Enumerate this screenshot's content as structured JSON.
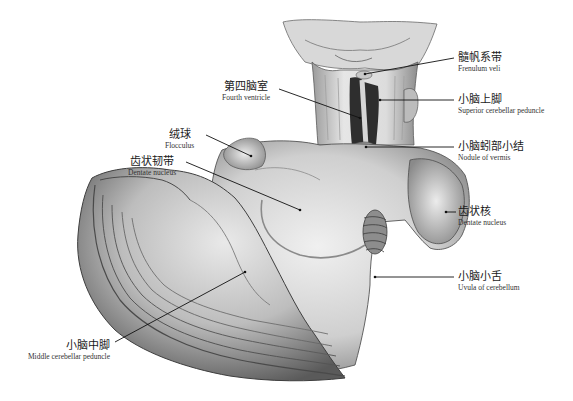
{
  "figure": {
    "colors": {
      "tissue_light": "#e8e8e8",
      "tissue_mid": "#b5b5b5",
      "tissue_dark": "#4a4a4a",
      "line": "#111111",
      "background": "#ffffff"
    }
  },
  "labels": [
    {
      "id": "frenulum-veli",
      "zh": "髓帆系带",
      "en": "Frenulum veli"
    },
    {
      "id": "fourth-ventricle",
      "zh": "第四脑室",
      "en": "Fourth ventricle"
    },
    {
      "id": "superior-cerebellar-peduncle",
      "zh": "小脑上脚",
      "en": "Superior cerebellar peduncle"
    },
    {
      "id": "flocculus",
      "zh": "绒球",
      "en": "Flocculus"
    },
    {
      "id": "nodule-of-vermis",
      "zh": "小脑蚓部小结",
      "en": "Nodule of vermis"
    },
    {
      "id": "dentate-ligament",
      "zh": "齿状韧带",
      "en": "Dentate nucleus"
    },
    {
      "id": "dentate-nucleus",
      "zh": "齿状核",
      "en": "Dentate nucleus"
    },
    {
      "id": "uvula-of-cerebellum",
      "zh": "小脑小舌",
      "en": "Uvula of cerebellum"
    },
    {
      "id": "middle-cerebellar-peduncle",
      "zh": "小脑中脚",
      "en": "Middle cerebellar peduncle"
    }
  ],
  "caption": {
    "text": "···· ··· ···· ·· ··· ·· ·· ··· ······· ·· ········ ······"
  }
}
